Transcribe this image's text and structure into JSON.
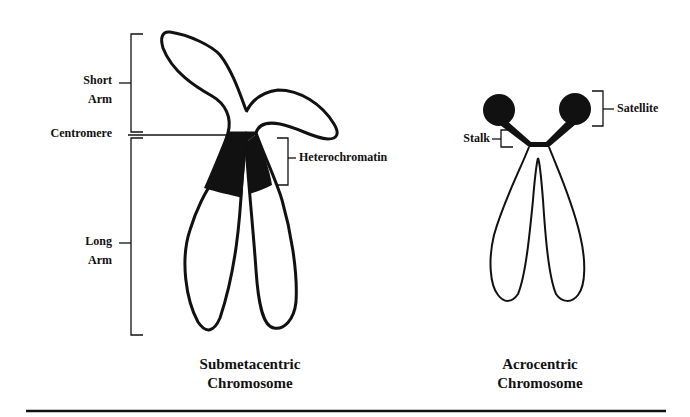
{
  "diagram": {
    "left_chromosome": {
      "caption_line1": "Submetacentric",
      "caption_line2": "Chromosome",
      "labels": {
        "short_arm_line1": "Short",
        "short_arm_line2": "Arm",
        "centromere": "Centromere",
        "heterochromatin": "Heterochromatin",
        "long_arm_line1": "Long",
        "long_arm_line2": "Arm"
      }
    },
    "right_chromosome": {
      "caption_line1": "Acrocentric",
      "caption_line2": "Chromosome",
      "labels": {
        "satellite": "Satellite",
        "stalk": "Stalk"
      }
    },
    "colors": {
      "ink": "#111111",
      "background": "#ffffff"
    }
  }
}
